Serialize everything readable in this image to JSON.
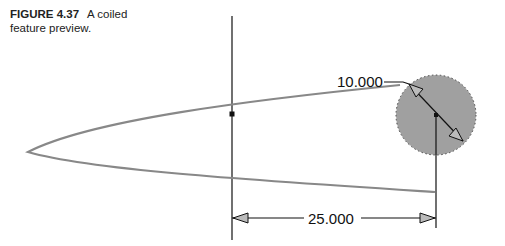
{
  "caption": {
    "label": "FIGURE 4.37",
    "text": "A coiled feature preview."
  },
  "dimensions": {
    "diameter": "10.000",
    "length": "25.000"
  },
  "colors": {
    "profile_fill": "#a0a0a0",
    "coil_stroke": "#888888",
    "line": "#111111"
  }
}
